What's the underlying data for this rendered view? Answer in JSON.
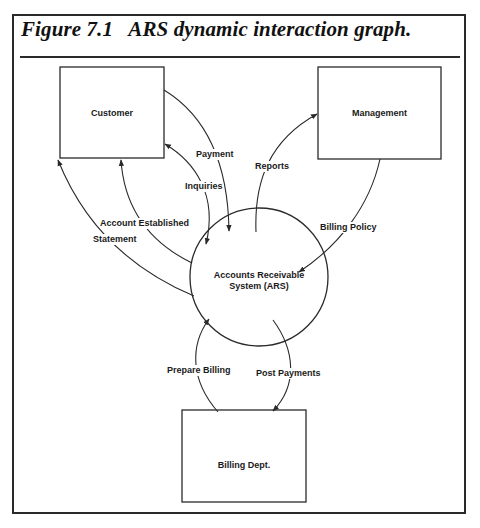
{
  "figure": {
    "title": "Figure 7.1   ARS dynamic interaction graph."
  },
  "nodes": {
    "customer": {
      "label": "Customer",
      "shape": "rectangle"
    },
    "management": {
      "label": "Management",
      "shape": "rectangle"
    },
    "ars": {
      "label_line1": "Accounts Receivable",
      "label_line2": "System (ARS)",
      "shape": "circle"
    },
    "billing": {
      "label": "Billing Dept.",
      "shape": "rectangle"
    }
  },
  "edges": {
    "payment": {
      "label": "Payment",
      "from": "Customer",
      "to": "Accounts Receivable System (ARS)"
    },
    "inquiries": {
      "label": "Inquiries",
      "from": "Customer",
      "to": "Accounts Receivable System (ARS)",
      "bidirectional": true
    },
    "account_established": {
      "label": "Account Established",
      "from": "Accounts Receivable System (ARS)",
      "to": "Customer"
    },
    "statement": {
      "label": "Statement",
      "from": "Accounts Receivable System (ARS)",
      "to": "Customer"
    },
    "reports": {
      "label": "Reports",
      "from": "Accounts Receivable System (ARS)",
      "to": "Management"
    },
    "billing_policy": {
      "label": "Billing Policy",
      "from": "Management",
      "to": "Accounts Receivable System (ARS)"
    },
    "prepare_billing": {
      "label": "Prepare Billing",
      "from": "Billing Dept.",
      "to": "Accounts Receivable System (ARS)"
    },
    "post_payments": {
      "label": "Post Payments",
      "from": "Accounts Receivable System (ARS)",
      "to": "Billing Dept."
    }
  },
  "colors": {
    "line": "#2a2a2a",
    "text": "#1a1a1a",
    "background": "#ffffff"
  }
}
